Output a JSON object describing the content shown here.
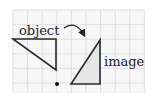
{
  "diagram": {
    "labels": {
      "object": "object",
      "image": "image"
    },
    "grid": {
      "x0": 13,
      "y0": 10,
      "x1": 145,
      "y1": 93,
      "cell": 14.6,
      "color": "#d9d9d9",
      "background": "#f7f7f7"
    },
    "object_triangle": {
      "points": "13,39 56,39 56,70",
      "stroke": "#2a2a2a"
    },
    "image_triangle": {
      "points": "71,84 100,40 100,84",
      "stroke": "#2a2a2a",
      "fill": "#e6e6e6"
    },
    "center_dot": {
      "cx": 57,
      "cy": 84,
      "r": 2
    },
    "arrow": {
      "path": "M64,28 Q76,20 84,35",
      "stroke": "#222222"
    }
  }
}
